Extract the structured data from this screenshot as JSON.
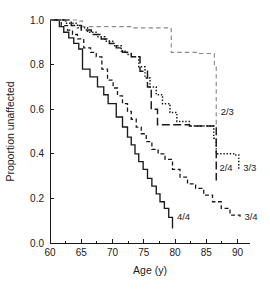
{
  "chart_data": {
    "type": "line",
    "title": "",
    "xlabel": "Age (y)",
    "ylabel": "Proportion unaffected",
    "xlim": [
      60,
      92
    ],
    "ylim": [
      0.0,
      1.0
    ],
    "grid": false,
    "legend_position": "inline-end-of-curve",
    "xticks": [
      60,
      65,
      70,
      75,
      80,
      85,
      90
    ],
    "xtick_labels": [
      "60",
      "65",
      "70",
      "75",
      "80",
      "85",
      "90"
    ],
    "x_minor_ticks": [
      62.5,
      67.5,
      72.5,
      77.5,
      82.5,
      87.5
    ],
    "yticks": [
      0.0,
      0.2,
      0.4,
      0.6,
      0.8,
      1.0
    ],
    "ytick_labels": [
      "0.0",
      "0.2",
      "0.4",
      "0.6",
      "0.8",
      "1.0"
    ],
    "series": [
      {
        "name": "4/4",
        "label": "4/4",
        "style": "solid",
        "color": "#1a1a1a",
        "x": [
          60,
          61.5,
          62.2,
          63.0,
          63.8,
          64.6,
          65.2,
          66.4,
          67.6,
          68.6,
          69.3,
          70.6,
          71.6,
          72.4,
          73.0,
          73.6,
          74.2,
          74.9,
          75.6,
          76.3,
          77.0,
          77.6,
          78.3,
          79.0,
          79.6
        ],
        "y": [
          1.0,
          0.97,
          0.945,
          0.92,
          0.895,
          0.87,
          0.78,
          0.745,
          0.7,
          0.665,
          0.625,
          0.565,
          0.52,
          0.475,
          0.44,
          0.4,
          0.365,
          0.33,
          0.29,
          0.255,
          0.22,
          0.185,
          0.155,
          0.115,
          0.065
        ]
      },
      {
        "name": "3/4",
        "label": "3/4",
        "style": "dashed",
        "color": "#1a1a1a",
        "x": [
          60,
          61.8,
          62.8,
          63.6,
          64.4,
          65.4,
          66.5,
          67.4,
          68.3,
          69.2,
          70.1,
          70.8,
          71.6,
          72.4,
          73.0,
          73.8,
          74.6,
          75.4,
          76.3,
          77.3,
          78.4,
          79.6,
          80.8,
          82.0,
          83.3,
          84.6,
          86.0,
          87.4,
          88.8,
          90.4
        ],
        "y": [
          1.0,
          0.975,
          0.955,
          0.935,
          0.915,
          0.875,
          0.855,
          0.835,
          0.78,
          0.73,
          0.695,
          0.66,
          0.625,
          0.59,
          0.555,
          0.52,
          0.49,
          0.455,
          0.42,
          0.4,
          0.375,
          0.33,
          0.295,
          0.265,
          0.245,
          0.215,
          0.185,
          0.155,
          0.125,
          0.11
        ]
      },
      {
        "name": "2/4",
        "label": "2/4",
        "style": "longdash",
        "color": "#1a1a1a",
        "x": [
          60,
          63.4,
          65.0,
          66.6,
          68.2,
          69.5,
          70.6,
          71.6,
          73.0,
          74.4,
          75.6,
          76.2,
          77.2,
          82.3,
          86.3,
          86.6
        ],
        "y": [
          1.0,
          0.975,
          0.955,
          0.935,
          0.915,
          0.895,
          0.875,
          0.855,
          0.835,
          0.77,
          0.7,
          0.6,
          0.53,
          0.525,
          0.52,
          0.28
        ]
      },
      {
        "name": "3/3",
        "label": "3/3",
        "style": "dotted",
        "color": "#1a1a1a",
        "x": [
          60,
          62.5,
          64.4,
          66.0,
          67.5,
          68.8,
          70.2,
          71.4,
          72.3,
          73.2,
          74.2,
          75.2,
          76.0,
          77.0,
          78.0,
          79.2,
          80.3,
          82.3,
          86.2,
          86.6,
          89.6,
          90.2
        ],
        "y": [
          1.0,
          0.985,
          0.965,
          0.945,
          0.925,
          0.905,
          0.885,
          0.86,
          0.845,
          0.835,
          0.79,
          0.74,
          0.7,
          0.665,
          0.625,
          0.585,
          0.545,
          0.525,
          0.47,
          0.4,
          0.395,
          0.33
        ]
      },
      {
        "name": "2/3",
        "label": "2/3",
        "style": "gray-dashed",
        "color": "#8c8c8c",
        "x": [
          60,
          64.4,
          65.2,
          73.4,
          78.8,
          79.4,
          83.6,
          86.3,
          86.6
        ],
        "y": [
          1.0,
          0.995,
          0.97,
          0.965,
          0.96,
          0.855,
          0.85,
          0.8,
          0.53
        ]
      }
    ],
    "annotations": [
      {
        "text": "2/3",
        "x": 87.3,
        "y": 0.575,
        "series": "2/3"
      },
      {
        "text": "2/4",
        "x": 87.1,
        "y": 0.325,
        "series": "2/4"
      },
      {
        "text": "3/3",
        "x": 90.9,
        "y": 0.325,
        "series": "3/3"
      },
      {
        "text": "4/4",
        "x": 80.3,
        "y": 0.105,
        "series": "4/4"
      },
      {
        "text": "3/4",
        "x": 91.1,
        "y": 0.105,
        "series": "3/4"
      }
    ]
  },
  "colors": {
    "axis": "#1a1a1a",
    "text": "#1a1a1a",
    "series_default": "#1a1a1a",
    "series_gray": "#8c8c8c",
    "background": "#ffffff"
  }
}
